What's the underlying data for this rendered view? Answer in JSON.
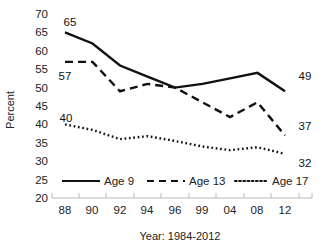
{
  "chart_data": {
    "type": "line",
    "title": "",
    "xlabel": "Year: 1984-2012",
    "ylabel": "Percent",
    "categories": [
      "88",
      "90",
      "92",
      "94",
      "96",
      "99",
      "04",
      "08",
      "12"
    ],
    "ylim": [
      20,
      70
    ],
    "yticks": [
      20,
      25,
      30,
      35,
      40,
      45,
      50,
      55,
      60,
      65,
      70
    ],
    "grid": false,
    "legend_position": "bottom",
    "series": [
      {
        "name": "Age 9",
        "style": "solid",
        "color": "#111111",
        "values": [
          65,
          62,
          56,
          53,
          50,
          51,
          52.5,
          54,
          49
        ],
        "start_label": "65",
        "end_label": "49"
      },
      {
        "name": "Age 13",
        "style": "dashed",
        "color": "#111111",
        "values": [
          57,
          57,
          49,
          51,
          50,
          46,
          42,
          46,
          37
        ],
        "start_label": "57",
        "end_label": "37"
      },
      {
        "name": "Age 17",
        "style": "dotted",
        "color": "#111111",
        "values": [
          40,
          38.5,
          36,
          36.8,
          35.5,
          34,
          33,
          33.8,
          32
        ],
        "start_label": "40",
        "end_label": "32"
      }
    ]
  },
  "labels": {
    "y_20": "20",
    "y_25": "25",
    "y_30": "30",
    "y_35": "35",
    "y_40": "40",
    "y_45": "45",
    "y_50": "50",
    "y_55": "55",
    "y_60": "60",
    "y_65": "65",
    "y_70": "70",
    "x_0": "88",
    "x_1": "90",
    "x_2": "92",
    "x_3": "94",
    "x_4": "96",
    "x_5": "99",
    "x_6": "04",
    "x_7": "08",
    "x_8": "12",
    "axis_x_title": "Year: 1984-2012",
    "axis_y_title": "Percent",
    "ann_65": "65",
    "ann_57": "57",
    "ann_40": "40",
    "ann_49": "49",
    "ann_37": "37",
    "ann_32": "32",
    "legend_age9": "Age 9",
    "legend_age13": "Age 13",
    "legend_age17": "Age 17"
  }
}
